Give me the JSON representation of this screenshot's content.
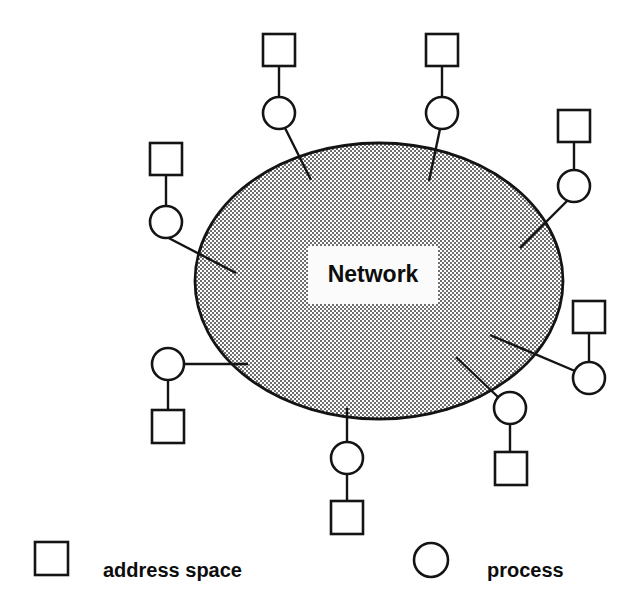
{
  "canvas": {
    "width": 621,
    "height": 612,
    "background": "#ffffff"
  },
  "diagram": {
    "title": "Network",
    "cloud": {
      "label": "Network",
      "shape": "ellipse",
      "cx": 379,
      "cy": 281,
      "rx": 184,
      "ry": 138,
      "fill_color": "#a8a8a8",
      "fill_style": "50% dither halftone",
      "stroke_color": "#141414",
      "label_box": {
        "x": 308,
        "y": 246,
        "width": 130,
        "height": 58,
        "fill": "#fbfbfb"
      }
    },
    "node_colors": {
      "stroke": "#141414",
      "fill": "#ffffff"
    },
    "node_geometry": {
      "square_size": 32,
      "circle_radius": 16
    },
    "nodes": [
      {
        "id": "node-top-left-inner",
        "position": "top",
        "address_space": {
          "x": 263,
          "y": 34,
          "w": 32,
          "h": 32
        },
        "process": {
          "cx": 279,
          "cy": 113,
          "r": 16
        },
        "stem": {
          "x1": 279,
          "y1": 66,
          "x2": 279,
          "y2": 97
        },
        "link": {
          "x1": 285,
          "y1": 128,
          "x2": 311,
          "y2": 180
        }
      },
      {
        "id": "node-top-right-inner",
        "position": "top",
        "address_space": {
          "x": 426,
          "y": 34,
          "w": 32,
          "h": 32
        },
        "process": {
          "cx": 442,
          "cy": 113,
          "r": 16
        },
        "stem": {
          "x1": 442,
          "y1": 66,
          "x2": 442,
          "y2": 97
        },
        "link": {
          "x1": 440,
          "y1": 129,
          "x2": 429,
          "y2": 181
        }
      },
      {
        "id": "node-upper-left",
        "position": "left",
        "address_space": {
          "x": 150,
          "y": 143,
          "w": 32,
          "h": 32
        },
        "process": {
          "cx": 166,
          "cy": 222,
          "r": 16
        },
        "stem": {
          "x1": 166,
          "y1": 175,
          "x2": 166,
          "y2": 206
        },
        "link": {
          "x1": 159,
          "y1": 233,
          "x2": 236,
          "y2": 273
        }
      },
      {
        "id": "node-upper-right",
        "position": "right",
        "address_space": {
          "x": 558,
          "y": 110,
          "w": 32,
          "h": 32
        },
        "process": {
          "cx": 574,
          "cy": 186,
          "r": 16
        },
        "stem": {
          "x1": 574,
          "y1": 142,
          "x2": 574,
          "y2": 170
        },
        "link": {
          "x1": 568,
          "y1": 200,
          "x2": 520,
          "y2": 248
        }
      },
      {
        "id": "node-mid-left",
        "position": "left",
        "address_space": {
          "x": 152,
          "y": 410,
          "w": 32,
          "h": 33
        },
        "process": {
          "cx": 168,
          "cy": 364,
          "r": 16
        },
        "stem": {
          "x1": 168,
          "y1": 380,
          "x2": 168,
          "y2": 410
        },
        "link": {
          "x1": 184,
          "y1": 364,
          "x2": 248,
          "y2": 364
        }
      },
      {
        "id": "node-mid-right",
        "position": "right",
        "address_space": {
          "x": 573,
          "y": 301,
          "w": 32,
          "h": 32
        },
        "process": {
          "cx": 589,
          "cy": 378,
          "r": 16
        },
        "stem": {
          "x1": 589,
          "y1": 333,
          "x2": 589,
          "y2": 362
        },
        "link": {
          "x1": 575,
          "y1": 371,
          "x2": 490,
          "y2": 335
        }
      },
      {
        "id": "node-lower-right",
        "position": "bottom-right",
        "address_space": {
          "x": 495,
          "y": 452,
          "w": 32,
          "h": 33
        },
        "process": {
          "cx": 510,
          "cy": 408,
          "r": 16
        },
        "stem": {
          "x1": 510,
          "y1": 424,
          "x2": 510,
          "y2": 452
        },
        "link": {
          "x1": 498,
          "y1": 397,
          "x2": 456,
          "y2": 357
        }
      },
      {
        "id": "node-bottom",
        "position": "bottom",
        "address_space": {
          "x": 331,
          "y": 501,
          "w": 32,
          "h": 33
        },
        "process": {
          "cx": 347,
          "cy": 458,
          "r": 16
        },
        "stem": {
          "x1": 347,
          "y1": 474,
          "x2": 347,
          "y2": 501
        },
        "link": {
          "x1": 347,
          "y1": 442,
          "x2": 347,
          "y2": 408
        }
      }
    ]
  },
  "legend": {
    "items": [
      {
        "id": "legend-address-space",
        "glyph": "square",
        "label": "address space",
        "shape": {
          "x": 35,
          "y": 542,
          "w": 33,
          "h": 33
        },
        "text_x": 103,
        "text_y": 572
      },
      {
        "id": "legend-process",
        "glyph": "circle",
        "label": "process",
        "shape": {
          "cx": 431,
          "cy": 560,
          "r": 17
        },
        "text_x": 487,
        "text_y": 572
      }
    ]
  }
}
